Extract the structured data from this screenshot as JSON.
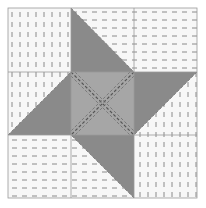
{
  "block": {
    "name": "Friendship Star quilt block",
    "grid": "3x3",
    "colors": {
      "background": "#ffffff",
      "light_fabric": "#f7f7f7",
      "dark_fabric": "#8a8a8a",
      "center_fabric": "#a6a6a6",
      "stitch": "#6e6e6e",
      "seam": "#9a9a9a"
    }
  }
}
